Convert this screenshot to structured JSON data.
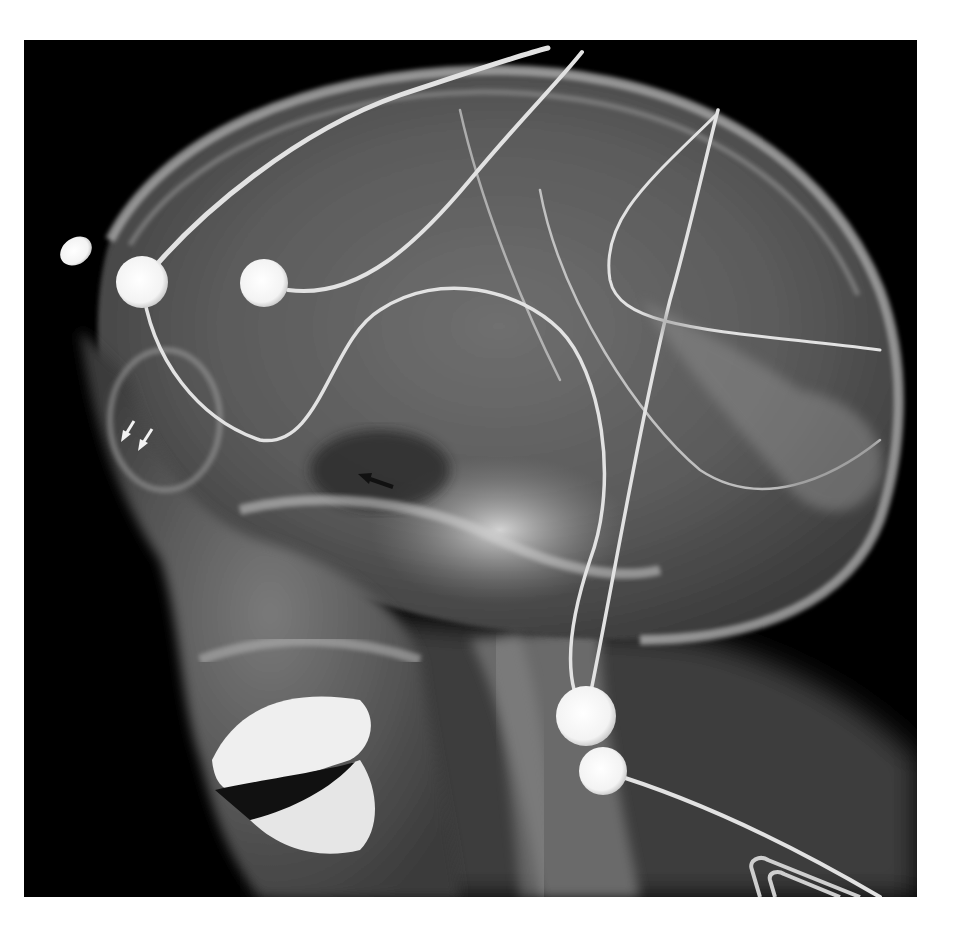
{
  "figure": {
    "type": "lateral-skull-radiograph",
    "background_color": "#000000",
    "page_color": "#ffffff",
    "frame": {
      "x": 24,
      "y": 40,
      "width": 893,
      "height": 857
    }
  },
  "annotations": {
    "white_arrows": [
      {
        "name": "white-arrow-1",
        "tip": [
          126,
          440
        ],
        "color": "#f2f2f2"
      },
      {
        "name": "white-arrow-2",
        "tip": [
          141,
          448
        ],
        "color": "#f2f2f2"
      }
    ],
    "black_arrow": {
      "name": "black-arrow",
      "tip": [
        362,
        478
      ],
      "color": "#111111"
    }
  },
  "overlays": {
    "electrodes": [
      {
        "name": "electrode-forehead-external",
        "cx": 76,
        "cy": 251,
        "rx": 17,
        "ry": 13
      },
      {
        "name": "electrode-frontal-1",
        "cx": 142,
        "cy": 282,
        "r": 26
      },
      {
        "name": "electrode-frontal-2",
        "cx": 264,
        "cy": 283,
        "r": 24
      },
      {
        "name": "electrode-neck-1",
        "cx": 586,
        "cy": 716,
        "r": 30
      },
      {
        "name": "electrode-neck-2",
        "cx": 603,
        "cy": 771,
        "r": 24
      }
    ]
  }
}
